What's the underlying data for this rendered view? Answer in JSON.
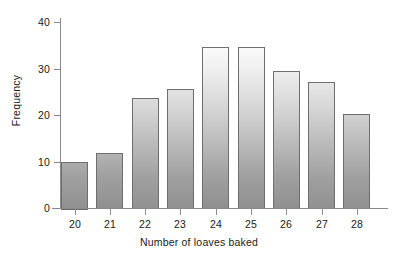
{
  "chart_data": {
    "type": "bar",
    "title": "",
    "xlabel": "Number of loaves baked",
    "ylabel": "Frequency",
    "categories": [
      "20",
      "21",
      "22",
      "23",
      "24",
      "25",
      "26",
      "27",
      "28"
    ],
    "values": [
      10.0,
      11.8,
      23.7,
      25.6,
      34.6,
      34.6,
      29.4,
      27.2,
      20.3
    ],
    "series": [
      {
        "name": "Frequency",
        "values": [
          10.0,
          11.8,
          23.7,
          25.6,
          34.6,
          34.6,
          29.4,
          27.2,
          20.3
        ]
      }
    ],
    "ylim": [
      0,
      42
    ],
    "yticks": [
      0,
      10,
      20,
      30,
      40
    ],
    "ytick_labels": [
      "0",
      "10",
      "20",
      "30",
      "40"
    ],
    "xlim": [
      19.5,
      28.5
    ],
    "grid": false,
    "legend": false,
    "legend_position": "none",
    "bar_fill": "#c0c0c0",
    "bar_edge": "#6e6e6e",
    "axis_color": "#8a8a8a",
    "background": "#ffffff",
    "text_color": "#202020"
  }
}
